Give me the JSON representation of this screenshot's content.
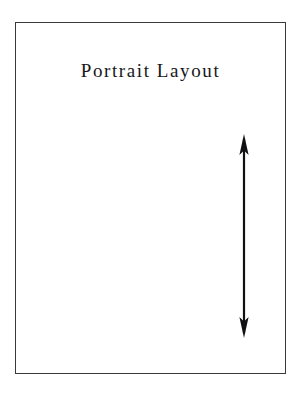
{
  "page": {
    "title": "Portrait Layout",
    "background_color": "#ffffff",
    "width": 302,
    "height": 396
  },
  "frame": {
    "name": "portrait-page-outline",
    "border_color": "#3a3a3c",
    "fill_color": "#ffffff",
    "left": 15,
    "top": 22,
    "width": 271,
    "height": 352
  },
  "annotation": {
    "arrow": {
      "icon": "double-headed-vertical-arrow-icon",
      "orientation": "vertical",
      "heads": "both",
      "color": "#111113",
      "center_x": 244,
      "top_y": 135,
      "bottom_y": 337,
      "length": 202
    }
  }
}
